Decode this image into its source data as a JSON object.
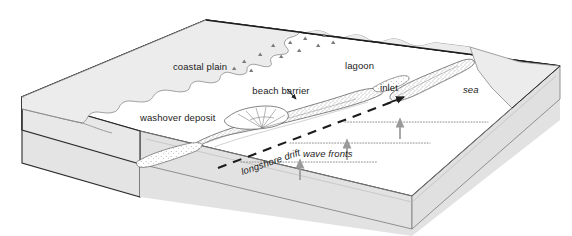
{
  "diagram": {
    "type": "geological block diagram",
    "colors": {
      "block_top_land": "#ececec",
      "block_top_water": "#ffffff",
      "block_side_left": "#e6e6e6",
      "block_side_front": "#e2e2e2",
      "outline": "#2b2b2b",
      "thin_line": "#6b6b6b",
      "sand_stipple": "#555555",
      "wave_arrow": "#9a9a9a",
      "wave_front_dots": "#8d8d8d",
      "background": "#ffffff"
    },
    "labels": {
      "coastal_plain": "coastal plain",
      "lagoon": "lagoon",
      "sea": "sea",
      "inlet": "inlet",
      "beach_barrier": "beach barrier",
      "washover_deposit": "washover deposit",
      "longshore_drift": "longshore drift",
      "wave_fronts": "wave fronts"
    },
    "label_styles": {
      "coastal_plain": "regular",
      "lagoon": "regular",
      "sea": "italic",
      "inlet": "regular",
      "beach_barrier": "regular",
      "washover_deposit": "regular",
      "longshore_drift": "italic",
      "wave_fronts": "italic"
    },
    "features": [
      {
        "name": "coastal-plain",
        "description": "shaded landmass at back left of block"
      },
      {
        "name": "lagoon",
        "description": "open water body behind the barrier"
      },
      {
        "name": "sea",
        "description": "open ocean at right front of block"
      },
      {
        "name": "beach-barrier",
        "description": "stippled elongate sand barrier island"
      },
      {
        "name": "inlet",
        "description": "tidal gap separating two barrier segments"
      },
      {
        "name": "washover-deposit",
        "description": "fan shaped sand lobe on lagoon side of barrier"
      },
      {
        "name": "longshore-drift",
        "description": "dashed arrow indicating sediment transport to the northeast"
      },
      {
        "name": "wave-fronts",
        "description": "dotted lines parallel to shore with arrows showing wave approach"
      }
    ],
    "annotations": {
      "longshore_drift_rotation_deg": -19,
      "wave_front_count": 3,
      "wave_arrow_count": 3,
      "marsh_symbol_count": 12
    }
  }
}
